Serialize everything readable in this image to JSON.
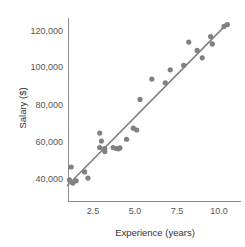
{
  "chart_data": {
    "type": "scatter",
    "title": "",
    "xlabel": "Experience (years)",
    "ylabel": "Salary ($)",
    "xlim": [
      0.6,
      10.9
    ],
    "ylim": [
      33000,
      128000
    ],
    "xticks": [
      2.5,
      5.0,
      7.5,
      10.0
    ],
    "xticklabels": [
      "2.5",
      "5.0",
      "7.5",
      "10.0"
    ],
    "yticks": [
      40000,
      60000,
      80000,
      100000,
      120000
    ],
    "yticklabels": [
      "40,000",
      "60,000",
      "80,000",
      "100,000",
      "120,000"
    ],
    "grid": false,
    "legend": null,
    "marker_color": "#808080",
    "line_color": "#808080",
    "axis_color": "#888888",
    "background_color": "#ffffff",
    "series": [
      {
        "name": "observations",
        "type": "scatter",
        "x": [
          1.1,
          1.2,
          1.3,
          1.5,
          2.0,
          2.2,
          2.9,
          2.9,
          3.0,
          3.2,
          3.2,
          3.7,
          3.9,
          4.0,
          4.1,
          4.5,
          4.9,
          5.1,
          5.3,
          6.0,
          6.8,
          7.1,
          7.9,
          8.2,
          8.7,
          9.0,
          9.5,
          9.6,
          10.3,
          10.5
        ],
        "y": [
          39500,
          46500,
          37800,
          39000,
          43800,
          40500,
          57000,
          64800,
          60500,
          54800,
          56500,
          57000,
          56500,
          56300,
          56800,
          61500,
          67500,
          66500,
          83000,
          94000,
          92000,
          99000,
          101500,
          114000,
          109500,
          105500,
          117000,
          113000,
          122500,
          123500
        ]
      },
      {
        "name": "regression-line",
        "type": "line",
        "x": [
          0.95,
          10.55
        ],
        "y": [
          36200,
          124500
        ]
      }
    ]
  },
  "axis": {
    "x_title": "Experience (years)",
    "y_title": "Salary ($)"
  }
}
